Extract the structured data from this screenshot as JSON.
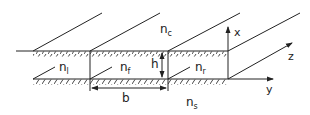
{
  "diagram": {
    "regions": {
      "cover": {
        "label": "n",
        "sub": "c"
      },
      "left": {
        "label": "n",
        "sub": "l"
      },
      "film": {
        "label": "n",
        "sub": "f"
      },
      "right": {
        "label": "n",
        "sub": "r"
      },
      "substrate": {
        "label": "n",
        "sub": "s"
      }
    },
    "dimensions": {
      "height": "h",
      "width": "b"
    },
    "axes": {
      "x": "x",
      "y": "y",
      "z": "z"
    },
    "colors": {
      "line": "#222222",
      "background": "#ffffff"
    }
  }
}
